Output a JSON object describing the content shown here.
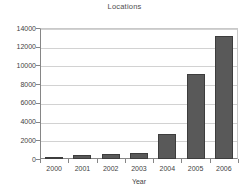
{
  "chart_data": {
    "type": "bar",
    "title": "Locations",
    "xlabel": "Year",
    "ylabel": "",
    "categories": [
      "2000",
      "2001",
      "2002",
      "2003",
      "2004",
      "2005",
      "2006"
    ],
    "values": [
      120,
      470,
      550,
      690,
      2650,
      9100,
      13200
    ],
    "ylim": [
      0,
      14000
    ],
    "ytick_labels": [
      "0",
      "2000",
      "4000",
      "6000",
      "8000",
      "10000",
      "12000",
      "14000"
    ],
    "ytick_values": [
      0,
      2000,
      4000,
      6000,
      8000,
      10000,
      12000,
      14000
    ],
    "grid": true,
    "legend": false,
    "bar_color": "#595959",
    "bar_border_color": "#3d3d3d",
    "grid_color": "#d2d2d2",
    "axis_color": "#868686",
    "text_color": "#3f3f3f",
    "title_color": "#4d4d4d",
    "background": "#ffffff"
  }
}
